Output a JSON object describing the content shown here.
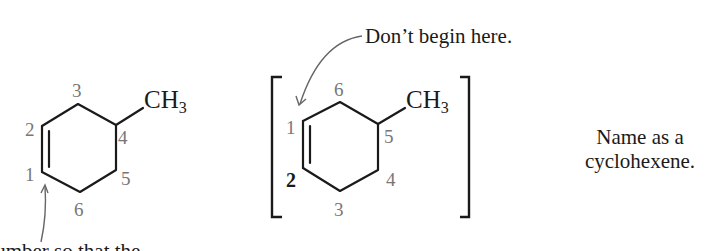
{
  "figure": {
    "left_structure": {
      "name": "correct-numbering-4-methylcyclohexene",
      "substituent": {
        "main": "CH",
        "sub": "3"
      },
      "locants": [
        "1",
        "2",
        "3",
        "4",
        "5",
        "6"
      ],
      "arrow_caption_partial": "Number so that the"
    },
    "right_structure": {
      "name": "incorrect-numbering-bracketed",
      "substituent": {
        "main": "CH",
        "sub": "3"
      },
      "locants": [
        "1",
        "2",
        "3",
        "4",
        "5",
        "6"
      ],
      "highlighted_locant": "2",
      "arrow_caption": "Don’t begin here."
    },
    "note": {
      "line1": "Name as a",
      "line2": "cyclohexene."
    },
    "colors": {
      "ink": "#1a1a1a",
      "locant_gray": "#777777",
      "arrow_gray": "#666666",
      "background": "#ffffff"
    }
  }
}
